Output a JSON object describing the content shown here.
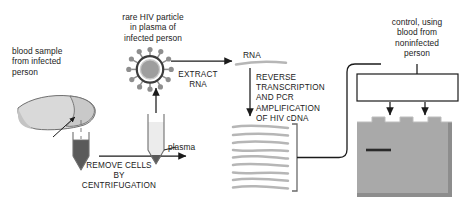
{
  "diagram": {
    "labels": {
      "blood_sample": "blood sample\nfrom infected\nperson",
      "hiv_particle": "rare HIV particle\nin plasma of\ninfected person",
      "remove_cells": "REMOVE CELLS\nBY\nCENTRIFUGATION",
      "plasma": "plasma",
      "extract_rna": "EXTRACT\nRNA",
      "rna": "RNA",
      "reverse_transcription": "REVERSE\nTRANSCRIPTION\nAND PCR\nAMPLIFICATION\nOF HIV cDNA",
      "gel_electrophoresis": "GEL\nELECTROPHORESIS",
      "control": "control, using\nblood from\nnoninfected\nperson"
    },
    "icons": {
      "virus": "hiv-virion-icon",
      "blood_tube": "blood-collection-tube-icon",
      "plasma_tube": "centrifuged-plasma-tube-icon",
      "finger": "fingertip-icon",
      "rna_strand": "rna-strand-icon",
      "cdna_bands": "cdna-strands-icon",
      "gel_slab": "gel-slab-icon",
      "dna_band": "dna-band-icon"
    },
    "counts": {
      "cdna_strands": 10,
      "virus_spikes": 12,
      "gel_wells": 3,
      "gel_arrows": 2,
      "dna_bands": 1
    },
    "colors": {
      "ink": "#1b1b1b",
      "gel_fill": "#a8a8a8",
      "gel_shadow": "#8f8f8f",
      "strand_gray": "#b6b6b6",
      "tube_outline": "#6f6f6f",
      "blood_dark": "#4a4a4a",
      "plasma_light": "#e8e8e8",
      "virus_core": "#9a9a9a",
      "background": "#ffffff"
    }
  }
}
